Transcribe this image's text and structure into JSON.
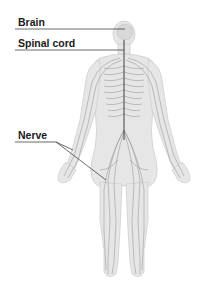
{
  "diagram": {
    "labels": [
      {
        "id": "brain",
        "text": "Brain"
      },
      {
        "id": "spinal_cord",
        "text": "Spinal cord"
      },
      {
        "id": "nerve",
        "text": "Nerve"
      }
    ],
    "colors": {
      "body_fill": "#e4e4e4",
      "body_stroke": "#c8c8c8",
      "nerve": "#8a8a8a",
      "spine": "#555555",
      "leader_line": "#444444",
      "label_text": "#1a1a1a"
    }
  }
}
